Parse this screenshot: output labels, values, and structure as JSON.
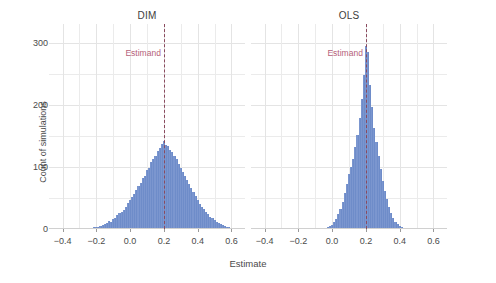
{
  "chart_data": {
    "type": "bar",
    "chart_kind": "histogram",
    "facet_variable": "estimator",
    "title": "",
    "xlabel": "Estimate",
    "ylabel": "Count of simulations",
    "xlim": [
      -0.48,
      0.68
    ],
    "ylim": [
      0,
      330
    ],
    "xticks": [
      -0.4,
      -0.2,
      0.0,
      0.2,
      0.4,
      0.6
    ],
    "xticklabels": [
      "−0.4",
      "−0.2",
      "0.0",
      "0.2",
      "0.4",
      "0.6"
    ],
    "yticks": [
      0,
      100,
      200,
      300
    ],
    "yticklabels": [
      "0",
      "100",
      "200",
      "300"
    ],
    "grid": true,
    "legend": "none",
    "bar_color": "#7b96cf",
    "annotation": {
      "label": "Estimand",
      "value": 0.2,
      "line_color": "#8a4a5e",
      "text_color": "#b5617a",
      "line_style": "dashed"
    },
    "bin_width": 0.0125,
    "panels": [
      {
        "name": "DIM",
        "label": "DIM",
        "bins": [
          {
            "x": -0.2875,
            "count": 1
          },
          {
            "x": -0.275,
            "count": 1
          },
          {
            "x": -0.2625,
            "count": 0
          },
          {
            "x": -0.25,
            "count": 2
          },
          {
            "x": -0.2375,
            "count": 1
          },
          {
            "x": -0.225,
            "count": 2
          },
          {
            "x": -0.2125,
            "count": 3
          },
          {
            "x": -0.2,
            "count": 3
          },
          {
            "x": -0.1875,
            "count": 4
          },
          {
            "x": -0.175,
            "count": 5
          },
          {
            "x": -0.1625,
            "count": 6
          },
          {
            "x": -0.15,
            "count": 8
          },
          {
            "x": -0.1375,
            "count": 10
          },
          {
            "x": -0.125,
            "count": 13
          },
          {
            "x": -0.1125,
            "count": 12
          },
          {
            "x": -0.1,
            "count": 16
          },
          {
            "x": -0.0875,
            "count": 18
          },
          {
            "x": -0.075,
            "count": 22
          },
          {
            "x": -0.0625,
            "count": 25
          },
          {
            "x": -0.05,
            "count": 28
          },
          {
            "x": -0.0375,
            "count": 31
          },
          {
            "x": -0.025,
            "count": 35
          },
          {
            "x": -0.0125,
            "count": 42
          },
          {
            "x": 0.0,
            "count": 46
          },
          {
            "x": 0.0125,
            "count": 52
          },
          {
            "x": 0.025,
            "count": 57
          },
          {
            "x": 0.0375,
            "count": 63
          },
          {
            "x": 0.05,
            "count": 70
          },
          {
            "x": 0.0625,
            "count": 74
          },
          {
            "x": 0.075,
            "count": 82
          },
          {
            "x": 0.0875,
            "count": 86
          },
          {
            "x": 0.1,
            "count": 95
          },
          {
            "x": 0.1125,
            "count": 99
          },
          {
            "x": 0.125,
            "count": 108
          },
          {
            "x": 0.1375,
            "count": 112
          },
          {
            "x": 0.15,
            "count": 118
          },
          {
            "x": 0.1625,
            "count": 126
          },
          {
            "x": 0.175,
            "count": 131
          },
          {
            "x": 0.1875,
            "count": 137
          },
          {
            "x": 0.2,
            "count": 141
          },
          {
            "x": 0.2125,
            "count": 136
          },
          {
            "x": 0.225,
            "count": 133
          },
          {
            "x": 0.2375,
            "count": 128
          },
          {
            "x": 0.25,
            "count": 124
          },
          {
            "x": 0.2625,
            "count": 117
          },
          {
            "x": 0.275,
            "count": 113
          },
          {
            "x": 0.2875,
            "count": 105
          },
          {
            "x": 0.3,
            "count": 98
          },
          {
            "x": 0.3125,
            "count": 92
          },
          {
            "x": 0.325,
            "count": 85
          },
          {
            "x": 0.3375,
            "count": 79
          },
          {
            "x": 0.35,
            "count": 72
          },
          {
            "x": 0.3625,
            "count": 66
          },
          {
            "x": 0.375,
            "count": 59
          },
          {
            "x": 0.3875,
            "count": 53
          },
          {
            "x": 0.4,
            "count": 47
          },
          {
            "x": 0.4125,
            "count": 41
          },
          {
            "x": 0.425,
            "count": 36
          },
          {
            "x": 0.4375,
            "count": 32
          },
          {
            "x": 0.45,
            "count": 28
          },
          {
            "x": 0.4625,
            "count": 24
          },
          {
            "x": 0.475,
            "count": 20
          },
          {
            "x": 0.4875,
            "count": 17
          },
          {
            "x": 0.5,
            "count": 14
          },
          {
            "x": 0.5125,
            "count": 12
          },
          {
            "x": 0.525,
            "count": 10
          },
          {
            "x": 0.5375,
            "count": 8
          },
          {
            "x": 0.55,
            "count": 6
          },
          {
            "x": 0.5625,
            "count": 5
          },
          {
            "x": 0.575,
            "count": 4
          },
          {
            "x": 0.5875,
            "count": 3
          },
          {
            "x": 0.6,
            "count": 2
          },
          {
            "x": 0.6125,
            "count": 2
          },
          {
            "x": 0.625,
            "count": 1
          },
          {
            "x": 0.6375,
            "count": 1
          }
        ]
      },
      {
        "name": "OLS",
        "label": "OLS",
        "bins": [
          {
            "x": -0.0625,
            "count": 1
          },
          {
            "x": -0.05,
            "count": 1
          },
          {
            "x": -0.0375,
            "count": 2
          },
          {
            "x": -0.025,
            "count": 3
          },
          {
            "x": -0.0125,
            "count": 5
          },
          {
            "x": 0.0,
            "count": 7
          },
          {
            "x": 0.0125,
            "count": 11
          },
          {
            "x": 0.025,
            "count": 16
          },
          {
            "x": 0.0375,
            "count": 24
          },
          {
            "x": 0.05,
            "count": 33
          },
          {
            "x": 0.0625,
            "count": 44
          },
          {
            "x": 0.075,
            "count": 58
          },
          {
            "x": 0.0875,
            "count": 72
          },
          {
            "x": 0.1,
            "count": 88
          },
          {
            "x": 0.1125,
            "count": 100
          },
          {
            "x": 0.125,
            "count": 112
          },
          {
            "x": 0.1375,
            "count": 132
          },
          {
            "x": 0.15,
            "count": 152
          },
          {
            "x": 0.1625,
            "count": 178
          },
          {
            "x": 0.175,
            "count": 210
          },
          {
            "x": 0.1875,
            "count": 248
          },
          {
            "x": 0.2,
            "count": 295
          },
          {
            "x": 0.2125,
            "count": 285
          },
          {
            "x": 0.225,
            "count": 232
          },
          {
            "x": 0.2375,
            "count": 196
          },
          {
            "x": 0.25,
            "count": 163
          },
          {
            "x": 0.2625,
            "count": 140
          },
          {
            "x": 0.275,
            "count": 118
          },
          {
            "x": 0.2875,
            "count": 96
          },
          {
            "x": 0.3,
            "count": 78
          },
          {
            "x": 0.3125,
            "count": 62
          },
          {
            "x": 0.325,
            "count": 48
          },
          {
            "x": 0.3375,
            "count": 36
          },
          {
            "x": 0.35,
            "count": 26
          },
          {
            "x": 0.3625,
            "count": 18
          },
          {
            "x": 0.375,
            "count": 12
          },
          {
            "x": 0.3875,
            "count": 8
          },
          {
            "x": 0.4,
            "count": 5
          },
          {
            "x": 0.4125,
            "count": 3
          },
          {
            "x": 0.425,
            "count": 2
          },
          {
            "x": 0.4375,
            "count": 1
          }
        ]
      }
    ]
  }
}
